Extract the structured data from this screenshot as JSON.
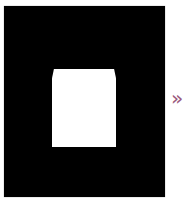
{
  "image": {
    "background_color": "#000000",
    "shape_color": "#ffffff"
  },
  "navigation": {
    "next_glyph": "»",
    "next_color": "#9b5a7e"
  }
}
